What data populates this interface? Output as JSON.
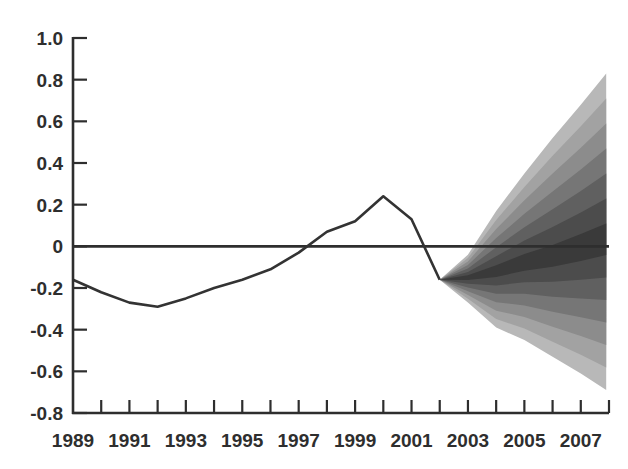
{
  "chart_data": {
    "type": "area",
    "subtype": "fan-chart",
    "title": "",
    "xlabel": "",
    "ylabel": "",
    "xlim": [
      1989,
      2008
    ],
    "ylim": [
      -0.8,
      1.0
    ],
    "grid": false,
    "legend": null,
    "y_ticks": [
      1.0,
      0.8,
      0.6,
      0.4,
      0.2,
      0,
      -0.2,
      -0.4,
      -0.6,
      -0.8
    ],
    "y_tick_labels": [
      "1.0",
      "0.8",
      "0.6",
      "0.4",
      "0.2",
      "0",
      "-0.2",
      "-0.4",
      "-0.6",
      "-0.8"
    ],
    "x_ticks": [
      1989,
      1990,
      1991,
      1992,
      1993,
      1994,
      1995,
      1996,
      1997,
      1998,
      1999,
      2000,
      2001,
      2002,
      2003,
      2004,
      2005,
      2006,
      2007,
      2008
    ],
    "x_tick_labels": [
      "1989",
      "1991",
      "1993",
      "1995",
      "1997",
      "1999",
      "2001",
      "2003",
      "2005",
      "2007"
    ],
    "x_tick_label_years": [
      1989,
      1991,
      1993,
      1995,
      1997,
      1999,
      2001,
      2003,
      2005,
      2007
    ],
    "reference_line": {
      "y": 0
    },
    "series": [
      {
        "name": "historical",
        "x": [
          1989,
          1990,
          1991,
          1992,
          1993,
          1994,
          1995,
          1996,
          1997,
          1998,
          1999,
          2000,
          2001,
          2002
        ],
        "values": [
          -0.16,
          -0.22,
          -0.27,
          -0.29,
          -0.25,
          -0.2,
          -0.16,
          -0.11,
          -0.03,
          0.07,
          0.12,
          0.24,
          0.13,
          -0.16
        ]
      }
    ],
    "fan": {
      "name": "projection",
      "x": [
        2002,
        2003,
        2004,
        2005,
        2006,
        2007,
        2007.9
      ],
      "upper": [
        -0.16,
        -0.04,
        0.17,
        0.35,
        0.52,
        0.68,
        0.83
      ],
      "lower": [
        -0.16,
        -0.27,
        -0.39,
        -0.45,
        -0.53,
        -0.61,
        -0.69
      ],
      "band_fractions_from_outer": [
        1.0,
        0.85,
        0.7,
        0.55,
        0.4,
        0.25,
        0.1
      ],
      "band_colors": [
        "#b8b8b8",
        "#a2a2a2",
        "#8c8c8c",
        "#767676",
        "#606060",
        "#4c4c4c",
        "#3a3a3a"
      ],
      "center": [
        -0.16,
        -0.15,
        -0.12,
        -0.08,
        -0.05,
        -0.01,
        0.03
      ]
    }
  },
  "colors": {
    "axis": "#2e2e2e",
    "line": "#333333",
    "background": "#ffffff"
  }
}
